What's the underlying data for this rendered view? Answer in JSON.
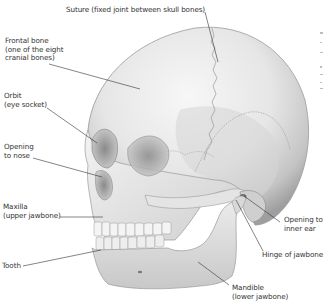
{
  "diagram": {
    "colors": {
      "bone_light": "#f2f2f2",
      "bone_mid": "#d9d9d9",
      "bone_shadow": "#a9a9a9",
      "bone_dark": "#7a7a7a",
      "leader_line": "#333333",
      "text": "#333333",
      "background": "#ffffff"
    },
    "labels": [
      {
        "id": "suture",
        "lines": [
          "Suture (fixed joint between skull bones)"
        ]
      },
      {
        "id": "frontal-bone",
        "lines": [
          "Frontal bone",
          "(one of the eight",
          "cranial bones)"
        ]
      },
      {
        "id": "orbit",
        "lines": [
          "Orbit",
          "(eye socket)"
        ]
      },
      {
        "id": "opening-to-nose",
        "lines": [
          "Opening",
          "to nose"
        ]
      },
      {
        "id": "maxilla",
        "lines": [
          "Maxilla",
          "(upper jawbone)"
        ]
      },
      {
        "id": "tooth",
        "lines": [
          "Tooth"
        ]
      },
      {
        "id": "opening-to-inner-ear",
        "lines": [
          "Opening to",
          "inner ear"
        ]
      },
      {
        "id": "hinge-of-jawbone",
        "lines": [
          "Hinge of jawbone"
        ]
      },
      {
        "id": "mandible",
        "lines": [
          "Mandible",
          "(lower jawbone)"
        ]
      }
    ]
  }
}
